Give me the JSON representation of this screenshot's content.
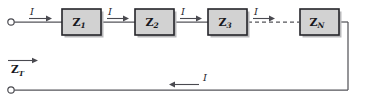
{
  "figure": {
    "type": "circuit-diagram",
    "background_color": "#ffffff",
    "wire_color": "#55555a",
    "box_fill_color": "#d2d2d2",
    "box_border_color": "#25252a",
    "label_color": "#17171c"
  },
  "impedances": [
    {
      "symbol": "Z",
      "subscript": "1",
      "x": 62,
      "y": 9,
      "width": 39,
      "height": 26
    },
    {
      "symbol": "Z",
      "subscript": "2",
      "x": 135,
      "y": 9,
      "width": 39,
      "height": 26
    },
    {
      "symbol": "Z",
      "subscript": "3",
      "x": 208,
      "y": 9,
      "width": 39,
      "height": 26
    },
    {
      "symbol": "Z",
      "subscript": "N",
      "x": 300,
      "y": 9,
      "width": 39,
      "height": 26
    }
  ],
  "current_labels": [
    {
      "text": "I",
      "x": 34,
      "y": 12,
      "direction": "right"
    },
    {
      "text": "I",
      "x": 112,
      "y": 12,
      "direction": "right"
    },
    {
      "text": "I",
      "x": 185,
      "y": 12,
      "direction": "right"
    },
    {
      "text": "I",
      "x": 258,
      "y": 12,
      "direction": "right"
    },
    {
      "text": "I",
      "x": 203,
      "y": 80,
      "direction": "left"
    }
  ],
  "total_impedance": {
    "symbol": "Z",
    "subscript": "T",
    "x": 8,
    "y": 63,
    "arrow": "right-overbar"
  },
  "terminals": [
    {
      "name": "top-input-terminal",
      "cx": 11,
      "cy": 22,
      "r": 3.2
    },
    {
      "name": "bottom-input-terminal",
      "cx": 11,
      "cy": 90,
      "r": 3.2
    }
  ],
  "connections": {
    "top_rail_y": 22,
    "bottom_rail_y": 90,
    "right_rail_x": 348,
    "dashed_segment": {
      "x1": 249,
      "x2": 298,
      "y": 22
    }
  }
}
